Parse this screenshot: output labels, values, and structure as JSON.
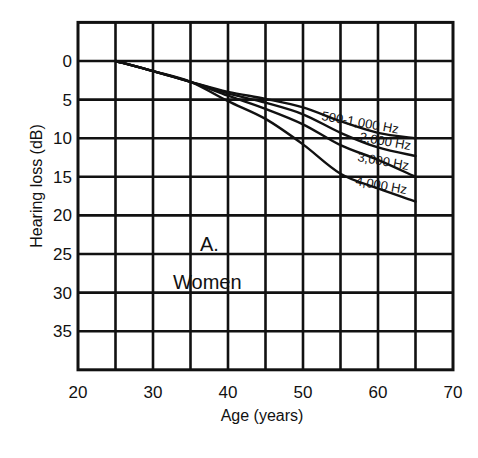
{
  "chart_data": {
    "type": "line",
    "title": "",
    "panel_label": "A.",
    "panel_subtitle": "Women",
    "xlabel": "Age (years)",
    "ylabel": "Hearing loss (dB)",
    "xlim": [
      20,
      70
    ],
    "ylim": [
      40,
      -5
    ],
    "y_inverted": true,
    "grid": true,
    "x_ticks": [
      20,
      30,
      40,
      50,
      60,
      70
    ],
    "y_ticks": [
      0,
      5,
      10,
      15,
      20,
      25,
      30,
      35
    ],
    "x_gridlines": [
      25,
      30,
      35,
      40,
      45,
      50,
      55,
      60,
      65
    ],
    "y_gridlines": [
      0,
      5,
      10,
      15,
      20,
      25,
      30,
      35
    ],
    "x": [
      25,
      30,
      35,
      40,
      45,
      50,
      55,
      60,
      65
    ],
    "series": [
      {
        "name": "500-1,000 Hz",
        "values": [
          0,
          1.3,
          2.7,
          4.0,
          4.9,
          6.0,
          7.8,
          9.3,
          10.0
        ]
      },
      {
        "name": "2,000 Hz",
        "values": [
          0,
          1.3,
          2.7,
          4.2,
          5.4,
          6.9,
          9.3,
          11.2,
          12.3
        ]
      },
      {
        "name": "3,000 Hz",
        "values": [
          0,
          1.3,
          2.7,
          4.5,
          6.2,
          8.2,
          10.9,
          12.8,
          15.0
        ]
      },
      {
        "name": "4,000 Hz",
        "values": [
          0,
          1.3,
          2.7,
          5.2,
          7.5,
          10.8,
          14.6,
          16.5,
          18.2
        ]
      }
    ],
    "legend_position": "inline labels near curve ends"
  }
}
